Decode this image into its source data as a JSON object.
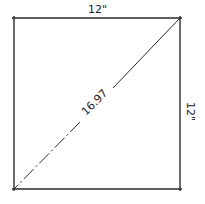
{
  "diagram": {
    "type": "square-with-diagonal",
    "labels": {
      "top": "12\"",
      "right": "12\"",
      "diagonal": "16.97"
    },
    "colors": {
      "stroke": "#2a2a2a",
      "background": "#ffffff"
    }
  }
}
